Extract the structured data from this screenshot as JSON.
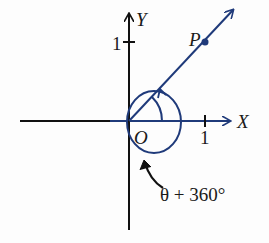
{
  "diagram": {
    "axis_x_label": "X",
    "axis_y_label": "Y",
    "origin_label": "O",
    "point_label": "P",
    "tick_x_label": "1",
    "tick_y_label": "1",
    "angle_label": "θ + 360°",
    "colors": {
      "axes": "#111111",
      "blue": "#1f3a7a",
      "text": "#1a1a1a"
    }
  }
}
